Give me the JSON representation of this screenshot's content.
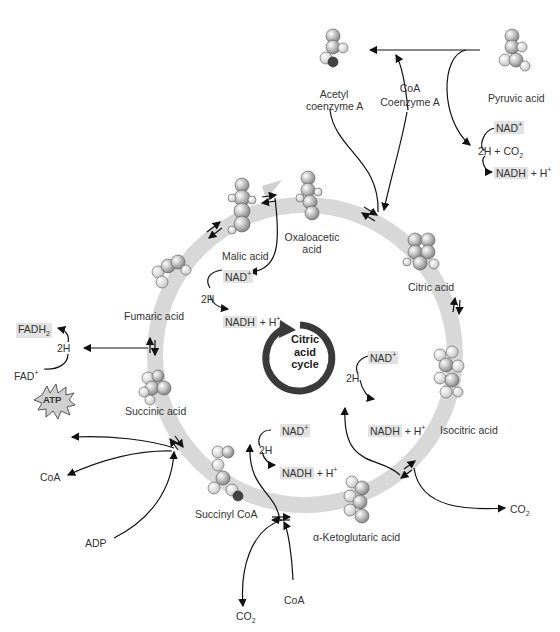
{
  "diagram": {
    "title": "Citric acid cycle",
    "center_label": [
      "Citric",
      "acid",
      "cycle"
    ],
    "colors": {
      "ring": "#d6d6d6",
      "center_arrow": "#3a3a3a",
      "highlight_box": "#e2e2e2",
      "molecule_box": "#ebebeb",
      "text": "#333333"
    },
    "entry": {
      "pyruvic_acid": "Pyruvic acid",
      "acetyl_coa_line1": "Acetyl",
      "acetyl_coa_line2": "coenzyme A",
      "coa": "CoA",
      "coenzyme_a": "Coenzyme A",
      "nad_plus": "NAD+",
      "two_h_co2": "2H + CO2",
      "nadh_h": "NADH + H+"
    },
    "intermediates": [
      {
        "name": "Oxaloacetic acid",
        "line1": "Oxaloacetic",
        "line2": "acid"
      },
      {
        "name": "Citric acid"
      },
      {
        "name": "Isocitric acid"
      },
      {
        "name": "α-Ketoglutaric acid"
      },
      {
        "name": "Succinyl CoA"
      },
      {
        "name": "Succinic acid"
      },
      {
        "name": "Fumaric acid"
      },
      {
        "name": "Malic acid"
      }
    ],
    "side_reactions": {
      "malate": {
        "nad": "NAD+",
        "two_h": "2H",
        "nadh": "NADH + H+"
      },
      "isocitrate": {
        "nad": "NAD+",
        "two_h": "2H",
        "nadh": "NADH + H+",
        "co2": "CO2"
      },
      "ketoglutarate": {
        "nad": "NAD+",
        "two_h": "2H",
        "nadh": "NADH + H+",
        "co2": "CO2",
        "coa": "CoA"
      },
      "succinyl": {
        "atp": "ATP",
        "coa": "CoA",
        "adp": "ADP"
      },
      "succinate": {
        "fadh2": "FADH2",
        "two_h": "2H",
        "fad": "FAD+"
      }
    }
  }
}
